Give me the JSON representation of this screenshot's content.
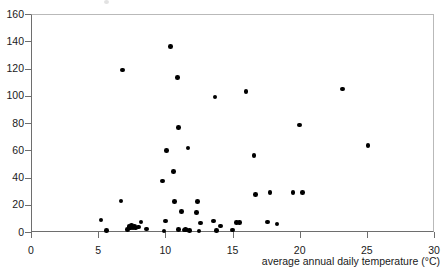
{
  "chart_data": {
    "type": "scatter",
    "title": "",
    "xlabel": "average annual daily temperature (°C)",
    "ylabel": "",
    "xlim": [
      0,
      30
    ],
    "ylim": [
      0,
      160
    ],
    "xticks": [
      0,
      5,
      10,
      15,
      20,
      25,
      30
    ],
    "yticks": [
      0,
      20,
      40,
      60,
      80,
      100,
      120,
      140,
      160
    ],
    "xtick_labels": [
      "0",
      "5",
      "10",
      "15",
      "20",
      "25",
      "30"
    ],
    "ytick_labels": [
      "0",
      "20",
      "40",
      "60",
      "80",
      "100",
      "120",
      "140",
      "160"
    ],
    "grid": false,
    "legend": null,
    "marker": "filled-circle",
    "marker_color": "#000000",
    "series": [
      {
        "name": "observations",
        "points": [
          [
            5.2,
            8.8
          ],
          [
            5.6,
            1.0
          ],
          [
            6.8,
            118.8
          ],
          [
            6.7,
            22.7
          ],
          [
            7.2,
            2.0
          ],
          [
            7.3,
            4.2
          ],
          [
            7.4,
            3.0
          ],
          [
            7.5,
            4.6
          ],
          [
            7.6,
            3.4
          ],
          [
            7.7,
            4.0
          ],
          [
            7.8,
            2.8
          ],
          [
            8.0,
            3.8
          ],
          [
            8.2,
            7.2
          ],
          [
            8.6,
            2.2
          ],
          [
            9.8,
            37.4
          ],
          [
            9.9,
            0.6
          ],
          [
            10.0,
            8.0
          ],
          [
            10.1,
            60.0
          ],
          [
            10.4,
            136.0
          ],
          [
            10.6,
            44.2
          ],
          [
            10.7,
            22.4
          ],
          [
            10.9,
            113.4
          ],
          [
            11.0,
            76.6
          ],
          [
            11.0,
            2.0
          ],
          [
            11.2,
            15.0
          ],
          [
            11.4,
            1.6
          ],
          [
            11.5,
            2.0
          ],
          [
            11.6,
            1.4
          ],
          [
            11.7,
            61.6
          ],
          [
            11.8,
            1.2
          ],
          [
            12.3,
            14.2
          ],
          [
            12.4,
            22.2
          ],
          [
            12.5,
            0.6
          ],
          [
            12.6,
            6.6
          ],
          [
            13.6,
            8.2
          ],
          [
            13.7,
            99.0
          ],
          [
            13.8,
            1.0
          ],
          [
            14.1,
            4.4
          ],
          [
            15.0,
            1.4
          ],
          [
            15.3,
            6.8
          ],
          [
            15.5,
            7.0
          ],
          [
            16.0,
            103.0
          ],
          [
            16.6,
            56.0
          ],
          [
            16.7,
            27.4
          ],
          [
            17.6,
            7.4
          ],
          [
            17.8,
            29.0
          ],
          [
            18.3,
            6.0
          ],
          [
            19.5,
            29.0
          ],
          [
            20.0,
            78.6
          ],
          [
            20.2,
            29.2
          ],
          [
            23.2,
            105.0
          ],
          [
            25.1,
            63.6
          ]
        ]
      }
    ]
  },
  "axis": {
    "x_title": "average annual daily temperature (°C)"
  }
}
